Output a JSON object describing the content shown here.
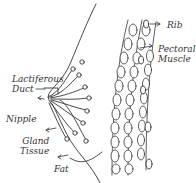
{
  "diagram": {
    "colors": {
      "ink": "#333333",
      "background": "#ffffff"
    },
    "labels": {
      "lactiferous_duct_line1": "Lactiferous",
      "lactiferous_duct_line2": "Duct",
      "nipple": "Nipple",
      "gland_tissue_line1": "Gland",
      "gland_tissue_line2": "Tissue",
      "fat": "Fat",
      "rib": "Rib",
      "pectoral_muscle_line1": "Pectoral",
      "pectoral_muscle_line2": "Muscle"
    }
  }
}
